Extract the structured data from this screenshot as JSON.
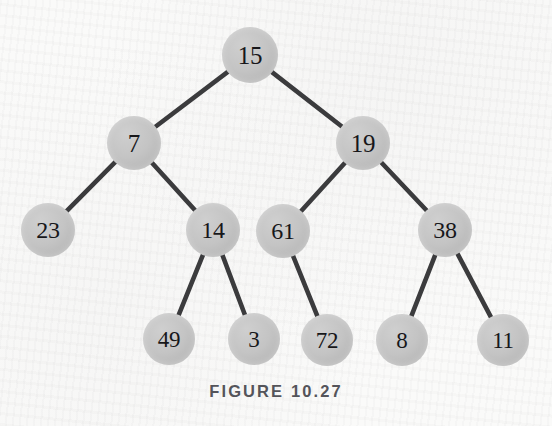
{
  "figure": {
    "caption": "FIGURE 10.27",
    "width": 552,
    "height": 426,
    "background_color": "#fbfbfa",
    "node_fill_color": "#c4c4c4",
    "node_text_color": "#17171a",
    "edge_color": "#3b3b3d",
    "caption_color": "#54545a"
  },
  "tree": {
    "type": "binary-tree",
    "root_id": "n15",
    "nodes": [
      {
        "id": "n15",
        "label": "15",
        "cx": 250,
        "cy": 55,
        "r": 28,
        "font_size": 25,
        "level": 0
      },
      {
        "id": "n7",
        "label": "7",
        "cx": 134,
        "cy": 143,
        "r": 27,
        "font_size": 25,
        "level": 1
      },
      {
        "id": "n19",
        "label": "19",
        "cx": 363,
        "cy": 143,
        "r": 27,
        "font_size": 25,
        "level": 1
      },
      {
        "id": "n23",
        "label": "23",
        "cx": 48,
        "cy": 230,
        "r": 27,
        "font_size": 24,
        "level": 2
      },
      {
        "id": "n14",
        "label": "14",
        "cx": 213,
        "cy": 230,
        "r": 27,
        "font_size": 24,
        "level": 2
      },
      {
        "id": "n61",
        "label": "61",
        "cx": 283,
        "cy": 231,
        "r": 27,
        "font_size": 24,
        "level": 2
      },
      {
        "id": "n38",
        "label": "38",
        "cx": 445,
        "cy": 230,
        "r": 27,
        "font_size": 24,
        "level": 2
      },
      {
        "id": "n49",
        "label": "49",
        "cx": 169,
        "cy": 339,
        "r": 26,
        "font_size": 23,
        "level": 3
      },
      {
        "id": "n3",
        "label": "3",
        "cx": 254,
        "cy": 339,
        "r": 26,
        "font_size": 23,
        "level": 3
      },
      {
        "id": "n72",
        "label": "72",
        "cx": 327,
        "cy": 340,
        "r": 26,
        "font_size": 23,
        "level": 3
      },
      {
        "id": "n8",
        "label": "8",
        "cx": 402,
        "cy": 340,
        "r": 26,
        "font_size": 23,
        "level": 3
      },
      {
        "id": "n11",
        "label": "11",
        "cx": 503,
        "cy": 340,
        "r": 26,
        "font_size": 23,
        "level": 3
      }
    ],
    "edges": [
      {
        "from": "n15",
        "to": "n7",
        "side": "left"
      },
      {
        "from": "n15",
        "to": "n19",
        "side": "right"
      },
      {
        "from": "n7",
        "to": "n23",
        "side": "left"
      },
      {
        "from": "n7",
        "to": "n14",
        "side": "right"
      },
      {
        "from": "n19",
        "to": "n61",
        "side": "left"
      },
      {
        "from": "n19",
        "to": "n38",
        "side": "right"
      },
      {
        "from": "n14",
        "to": "n49",
        "side": "left"
      },
      {
        "from": "n14",
        "to": "n3",
        "side": "right"
      },
      {
        "from": "n61",
        "to": "n72",
        "side": "right"
      },
      {
        "from": "n38",
        "to": "n8",
        "side": "left"
      },
      {
        "from": "n38",
        "to": "n11",
        "side": "right"
      }
    ],
    "edge_width": 4.6
  }
}
